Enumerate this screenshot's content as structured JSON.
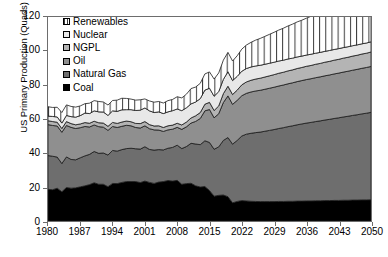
{
  "chart_data": {
    "type": "area",
    "stacked": true,
    "title": "",
    "xlabel": "",
    "ylabel": "US Primary Production (Quads)",
    "ylim": [
      0,
      120
    ],
    "xlim": [
      1980,
      2050
    ],
    "ytick_step": 20,
    "ytick_labels": [
      "0",
      "20",
      "40",
      "60",
      "80",
      "100",
      "120"
    ],
    "xtick_labels": [
      "1980",
      "1987",
      "1994",
      "2001",
      "2008",
      "2015",
      "2022",
      "2029",
      "2036",
      "2043",
      "2050"
    ],
    "grid": false,
    "legend_position": "upper-left-inside",
    "x": [
      1980,
      1981,
      1982,
      1983,
      1984,
      1985,
      1986,
      1987,
      1988,
      1989,
      1990,
      1991,
      1992,
      1993,
      1994,
      1995,
      1996,
      1997,
      1998,
      1999,
      2000,
      2001,
      2002,
      2003,
      2004,
      2005,
      2006,
      2007,
      2008,
      2009,
      2010,
      2011,
      2012,
      2013,
      2014,
      2015,
      2016,
      2017,
      2018,
      2019,
      2020,
      2021,
      2022,
      2023,
      2024,
      2025,
      2026,
      2027,
      2028,
      2029,
      2030,
      2031,
      2032,
      2033,
      2034,
      2035,
      2036,
      2037,
      2038,
      2039,
      2040,
      2041,
      2042,
      2043,
      2044,
      2045,
      2046,
      2047,
      2048,
      2049,
      2050
    ],
    "series": [
      {
        "name": "Coal",
        "fill": "#000000",
        "pattern": "solid",
        "values": [
          18.6,
          18.4,
          19.3,
          17.2,
          19.7,
          19.3,
          19.5,
          20.1,
          20.7,
          21.4,
          22.5,
          21.6,
          21.6,
          20.2,
          22.1,
          22.0,
          22.7,
          23.2,
          23.2,
          23.2,
          22.6,
          23.5,
          22.7,
          22.1,
          22.9,
          23.2,
          23.8,
          23.5,
          23.9,
          21.6,
          22.0,
          22.2,
          20.7,
          20.0,
          20.3,
          17.9,
          14.6,
          15.1,
          15.3,
          14.3,
          10.7,
          11.5,
          12.0,
          11.8,
          11.6,
          11.5,
          11.4,
          11.4,
          11.4,
          11.4,
          11.5,
          11.5,
          11.6,
          11.6,
          11.7,
          11.7,
          11.8,
          11.8,
          11.9,
          11.9,
          12.0,
          12.0,
          12.1,
          12.1,
          12.2,
          12.2,
          12.3,
          12.3,
          12.4,
          12.4,
          12.5
        ]
      },
      {
        "name": "Natural Gas",
        "fill": "#6e6e6e",
        "pattern": "solid",
        "values": [
          19.9,
          19.7,
          18.3,
          16.6,
          18.0,
          16.9,
          16.5,
          17.1,
          17.6,
          17.8,
          18.4,
          18.2,
          18.4,
          18.6,
          19.4,
          19.1,
          19.3,
          19.4,
          19.6,
          19.3,
          19.7,
          20.2,
          19.4,
          19.6,
          19.1,
          18.6,
          19.0,
          19.8,
          20.7,
          21.0,
          21.8,
          23.5,
          24.6,
          24.9,
          26.9,
          28.3,
          27.6,
          28.5,
          32.1,
          34.8,
          34.5,
          35.9,
          38.0,
          39.3,
          40.0,
          40.5,
          40.9,
          41.4,
          41.9,
          42.4,
          42.9,
          43.4,
          43.9,
          44.4,
          44.9,
          45.4,
          45.8,
          46.2,
          46.6,
          47.0,
          47.4,
          47.8,
          48.2,
          48.6,
          49.0,
          49.4,
          49.8,
          50.2,
          50.6,
          51.0,
          51.4
        ]
      },
      {
        "name": "Oil",
        "fill": "#8f8f8f",
        "pattern": "solid",
        "values": [
          18.2,
          18.1,
          18.3,
          18.4,
          18.5,
          18.9,
          18.4,
          17.7,
          17.3,
          16.1,
          15.6,
          15.7,
          15.2,
          14.5,
          14.1,
          13.9,
          13.7,
          13.7,
          13.2,
          12.5,
          12.4,
          12.3,
          12.2,
          11.9,
          11.5,
          10.9,
          10.8,
          10.7,
          10.5,
          11.3,
          11.6,
          11.9,
          13.3,
          15.4,
          17.6,
          19.4,
          18.5,
          19.5,
          22.3,
          24.5,
          23.4,
          23.6,
          23.7,
          24.0,
          24.3,
          24.5,
          24.6,
          24.7,
          24.8,
          24.9,
          25.0,
          25.1,
          25.2,
          25.3,
          25.4,
          25.5,
          25.6,
          25.7,
          25.8,
          25.9,
          26.0,
          26.1,
          26.2,
          26.3,
          26.4,
          26.5,
          26.6,
          26.7,
          26.8,
          26.9,
          27.0
        ]
      },
      {
        "name": "NGPL",
        "fill": "#b4b4b4",
        "pattern": "solid",
        "values": [
          2.3,
          2.3,
          2.2,
          2.2,
          2.3,
          2.2,
          2.2,
          2.2,
          2.3,
          2.2,
          2.2,
          2.3,
          2.4,
          2.4,
          2.4,
          2.4,
          2.5,
          2.5,
          2.4,
          2.4,
          2.6,
          2.5,
          2.4,
          2.3,
          2.5,
          2.3,
          2.4,
          2.4,
          2.4,
          2.6,
          2.8,
          3.0,
          3.3,
          3.5,
          3.9,
          4.2,
          4.3,
          4.6,
          5.2,
          5.7,
          5.8,
          6.0,
          6.4,
          6.7,
          6.9,
          7.0,
          7.1,
          7.2,
          7.3,
          7.4,
          7.5,
          7.5,
          7.6,
          7.6,
          7.7,
          7.7,
          7.8,
          7.8,
          7.9,
          7.9,
          8.0,
          8.0,
          8.1,
          8.1,
          8.2,
          8.2,
          8.3,
          8.3,
          8.4,
          8.4,
          8.5
        ]
      },
      {
        "name": "Nuclear",
        "fill": "#e8e8e8",
        "pattern": "solid",
        "values": [
          2.7,
          3.0,
          3.1,
          3.2,
          3.6,
          4.1,
          4.5,
          4.9,
          5.6,
          5.7,
          6.1,
          6.4,
          6.5,
          6.4,
          6.8,
          7.1,
          7.2,
          6.7,
          7.1,
          7.6,
          7.9,
          8.0,
          8.1,
          7.9,
          8.2,
          8.2,
          8.2,
          8.5,
          8.4,
          8.4,
          8.4,
          8.3,
          8.1,
          8.2,
          8.3,
          8.3,
          8.4,
          8.4,
          8.4,
          8.5,
          8.2,
          8.1,
          8.0,
          7.9,
          7.8,
          7.7,
          7.6,
          7.5,
          7.4,
          7.3,
          7.2,
          7.1,
          7.0,
          6.9,
          6.8,
          6.7,
          6.6,
          6.6,
          6.5,
          6.5,
          6.4,
          6.4,
          6.3,
          6.3,
          6.2,
          6.2,
          6.1,
          6.1,
          6.0,
          6.0,
          6.0
        ]
      },
      {
        "name": "Renewables",
        "fill": "#ffffff",
        "pattern": "vertical-hatch",
        "values": [
          5.5,
          5.3,
          5.7,
          6.2,
          6.2,
          6.0,
          5.9,
          5.7,
          5.5,
          6.1,
          6.0,
          6.1,
          5.9,
          6.1,
          6.1,
          6.6,
          6.8,
          6.6,
          6.2,
          6.1,
          6.1,
          5.3,
          5.8,
          6.1,
          6.1,
          6.2,
          6.6,
          6.6,
          7.2,
          7.5,
          8.0,
          9.0,
          8.8,
          9.0,
          9.5,
          9.6,
          10.1,
          11.0,
          11.3,
          11.4,
          11.5,
          12.1,
          13.0,
          13.8,
          14.5,
          15.2,
          15.8,
          16.4,
          17.0,
          17.6,
          18.2,
          18.8,
          19.4,
          20.0,
          20.6,
          21.1,
          21.7,
          22.3,
          22.9,
          23.5,
          24.1,
          24.7,
          25.3,
          25.9,
          26.5,
          27.1,
          27.7,
          28.3,
          28.9,
          29.5,
          30.1
        ]
      }
    ],
    "legend_entries": [
      {
        "label": "Renewables",
        "swatch": "vertical-hatch"
      },
      {
        "label": "Nuclear",
        "swatch": "#e8e8e8"
      },
      {
        "label": "NGPL",
        "swatch": "#b4b4b4"
      },
      {
        "label": "Oil",
        "swatch": "#8f8f8f"
      },
      {
        "label": "Natural Gas",
        "swatch": "#6e6e6e"
      },
      {
        "label": "Coal",
        "swatch": "#000000"
      }
    ]
  }
}
